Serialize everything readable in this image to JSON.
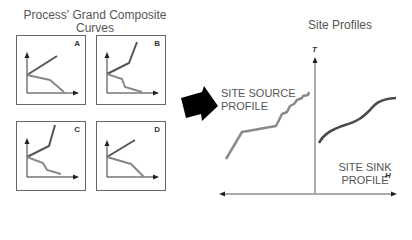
{
  "left_section": {
    "title_line1": "Process' Grand Composite",
    "title_line2": "Curves",
    "panels": [
      {
        "letter": "A"
      },
      {
        "letter": "B"
      },
      {
        "letter": "C"
      },
      {
        "letter": "D"
      }
    ]
  },
  "right_section": {
    "title": "Site Profiles",
    "y_axis_label": "T",
    "x_axis_label": "H",
    "source_label_line1": "SITE SOURCE",
    "source_label_line2": "PROFILE",
    "sink_label_line1": "SITE SINK",
    "sink_label_line2": "PROFILE"
  },
  "colors": {
    "upper_curve": "#555555",
    "lower_curve": "#888888",
    "source_curve": "#8a8a8a",
    "sink_curve": "#4a4a4a",
    "axis": "#333333",
    "arrow": "#000000"
  },
  "icons": {
    "transition_arrow": "right-down-arrow-icon"
  }
}
